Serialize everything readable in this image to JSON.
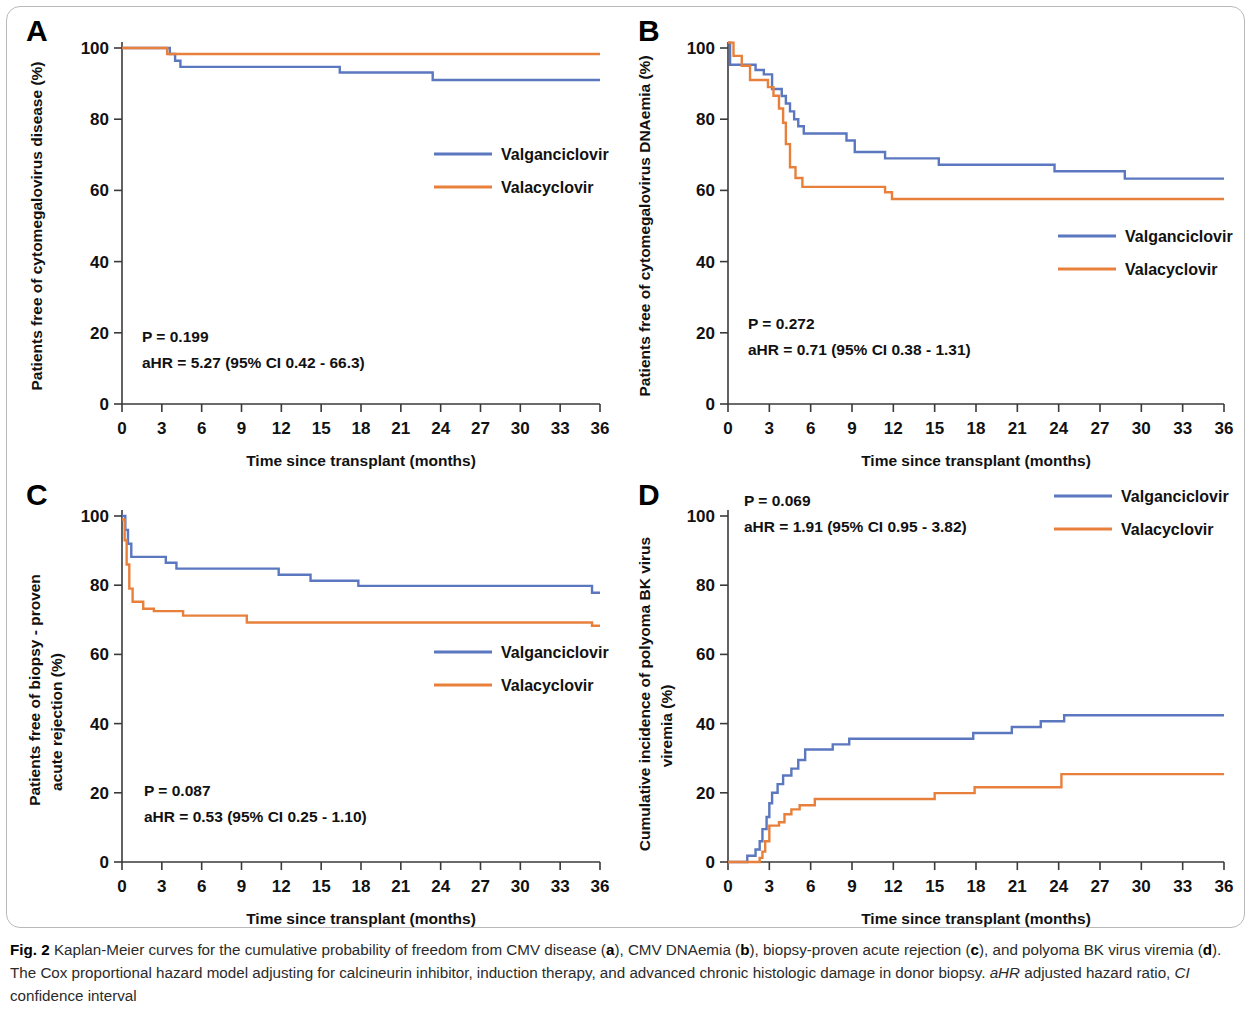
{
  "figure": {
    "label": "Fig. 2",
    "caption_part1": " Kaplan-Meier curves for the cumulative probability of freedom from CMV disease (",
    "caption_a": "a",
    "caption_part2": "), CMV DNAemia (",
    "caption_b": "b",
    "caption_part3": "), biopsy-proven acute rejection (",
    "caption_c": "c",
    "caption_part4": "), and polyoma BK virus viremia (",
    "caption_d": "d",
    "caption_part5": "). The Cox proportional hazard model adjusting for calcineurin inhibitor, induction therapy, and advanced chronic histologic damage in donor biopsy. ",
    "caption_ahr_abbr": "aHR",
    "caption_ahr_def": " adjusted hazard ratio, ",
    "caption_ci_abbr": "CI",
    "caption_ci_def": " confidence interval"
  },
  "colors": {
    "valganciclovir": "#5b77bf",
    "valacyclovir": "#e8803c",
    "axis": "#3a3a3a",
    "text": "#111111",
    "frame": "#b9b9b9"
  },
  "legend": {
    "series_1": "Valganciclovir",
    "series_2": "Valacyclovir"
  },
  "axis_common": {
    "xlabel": "Time since transplant (months)",
    "xticks": [
      "0",
      "3",
      "6",
      "9",
      "12",
      "15",
      "18",
      "21",
      "24",
      "27",
      "30",
      "33",
      "36"
    ],
    "yticks": [
      "0",
      "20",
      "40",
      "60",
      "80",
      "100"
    ],
    "xlim": [
      0,
      36
    ],
    "ylim": [
      0,
      100
    ]
  },
  "panels": {
    "A": {
      "letter": "A",
      "ylabel": "Patients free of cytomegalovirus disease (%)",
      "p_value": "P = 0.199",
      "ahr": "aHR = 5.27 (95% CI 0.42 - 66.3)"
    },
    "B": {
      "letter": "B",
      "ylabel": "Patients free of cytomegalovirus DNAemia (%)",
      "p_value": "P = 0.272",
      "ahr": "aHR = 0.71 (95% CI 0.38 - 1.31)"
    },
    "C": {
      "letter": "C",
      "ylabel_line1": "Patients free of biopsy - proven",
      "ylabel_line2": "acute rejection (%)",
      "p_value": "P = 0.087",
      "ahr": "aHR = 0.53 (95% CI 0.25 - 1.10)"
    },
    "D": {
      "letter": "D",
      "ylabel_line1": "Cumulative incidence of polyoma BK virus",
      "ylabel_line2": "viremia  (%)",
      "p_value": "P = 0.069",
      "ahr": "aHR = 1.91 (95% CI 0.95 - 3.82)"
    }
  },
  "chart_data": [
    {
      "panel": "A",
      "type": "line",
      "subtype": "kaplan-meier-step",
      "title": "Patients free of cytomegalovirus disease (%)",
      "xlabel": "Time since transplant (months)",
      "ylabel": "Patients free of cytomegalovirus disease (%)",
      "xlim": [
        0,
        36
      ],
      "ylim": [
        0,
        100
      ],
      "xticks": [
        0,
        3,
        6,
        9,
        12,
        15,
        18,
        21,
        24,
        27,
        30,
        33,
        36
      ],
      "yticks": [
        0,
        20,
        40,
        60,
        80,
        100
      ],
      "grid": false,
      "legend_position": "center-right",
      "annotations": [
        "P = 0.199",
        "aHR = 5.27 (95% CI 0.42 - 66.3)"
      ],
      "series": [
        {
          "name": "Valganciclovir",
          "color": "#5b77bf",
          "points": [
            [
              0,
              100
            ],
            [
              3.6,
              100
            ],
            [
              3.6,
              98.3
            ],
            [
              4.0,
              98.3
            ],
            [
              4.0,
              96.4
            ],
            [
              4.4,
              96.4
            ],
            [
              4.4,
              94.7
            ],
            [
              16.4,
              94.7
            ],
            [
              16.4,
              93.1
            ],
            [
              23.4,
              93.1
            ],
            [
              23.4,
              91.0
            ],
            [
              36,
              91.0
            ]
          ]
        },
        {
          "name": "Valacyclovir",
          "color": "#e8803c",
          "points": [
            [
              0,
              100
            ],
            [
              3.4,
              100
            ],
            [
              3.4,
              98.3
            ],
            [
              36,
              98.3
            ]
          ]
        }
      ]
    },
    {
      "panel": "B",
      "type": "line",
      "subtype": "kaplan-meier-step",
      "title": "Patients free of cytomegalovirus DNAemia (%)",
      "xlabel": "Time since transplant (months)",
      "ylabel": "Patients free of cytomegalovirus DNAemia (%)",
      "xlim": [
        0,
        36
      ],
      "ylim": [
        0,
        100
      ],
      "xticks": [
        0,
        3,
        6,
        9,
        12,
        15,
        18,
        21,
        24,
        27,
        30,
        33,
        36
      ],
      "yticks": [
        0,
        20,
        40,
        60,
        80,
        100
      ],
      "grid": false,
      "legend_position": "center-right",
      "annotations": [
        "P = 0.272",
        "aHR = 0.71 (95% CI 0.38 - 1.31)"
      ],
      "series": [
        {
          "name": "Valganciclovir",
          "color": "#5b77bf",
          "points": [
            [
              0,
              101.5
            ],
            [
              0.15,
              101.5
            ],
            [
              0.15,
              95.3
            ],
            [
              2.0,
              95.3
            ],
            [
              2.0,
              93.8
            ],
            [
              2.6,
              93.8
            ],
            [
              2.6,
              92.6
            ],
            [
              3.2,
              92.6
            ],
            [
              3.2,
              88.5
            ],
            [
              3.9,
              88.5
            ],
            [
              3.9,
              86.5
            ],
            [
              4.2,
              86.5
            ],
            [
              4.2,
              84.4
            ],
            [
              4.5,
              84.4
            ],
            [
              4.5,
              82.2
            ],
            [
              4.8,
              82.2
            ],
            [
              4.8,
              80.0
            ],
            [
              5.1,
              80.0
            ],
            [
              5.1,
              78.0
            ],
            [
              5.5,
              78.0
            ],
            [
              5.5,
              76.0
            ],
            [
              8.6,
              76.0
            ],
            [
              8.6,
              74.0
            ],
            [
              9.2,
              74.0
            ],
            [
              9.2,
              70.8
            ],
            [
              11.4,
              70.8
            ],
            [
              11.4,
              69.0
            ],
            [
              15.3,
              69.0
            ],
            [
              15.3,
              67.2
            ],
            [
              23.7,
              67.2
            ],
            [
              23.7,
              65.4
            ],
            [
              28.8,
              65.4
            ],
            [
              28.8,
              63.3
            ],
            [
              36,
              63.3
            ]
          ]
        },
        {
          "name": "Valacyclovir",
          "color": "#e8803c",
          "points": [
            [
              0,
              101.5
            ],
            [
              0.4,
              101.5
            ],
            [
              0.4,
              97.8
            ],
            [
              1.0,
              97.8
            ],
            [
              1.0,
              95.0
            ],
            [
              1.6,
              95.0
            ],
            [
              1.6,
              91.0
            ],
            [
              2.9,
              91.0
            ],
            [
              2.9,
              89.0
            ],
            [
              3.3,
              89.0
            ],
            [
              3.3,
              86.6
            ],
            [
              3.7,
              86.6
            ],
            [
              3.7,
              83.0
            ],
            [
              4.0,
              83.0
            ],
            [
              4.0,
              79.0
            ],
            [
              4.2,
              79.0
            ],
            [
              4.2,
              73.0
            ],
            [
              4.5,
              73.0
            ],
            [
              4.5,
              66.5
            ],
            [
              4.9,
              66.5
            ],
            [
              4.9,
              63.5
            ],
            [
              5.4,
              63.5
            ],
            [
              5.4,
              61.0
            ],
            [
              11.4,
              61.0
            ],
            [
              11.4,
              59.5
            ],
            [
              11.9,
              59.5
            ],
            [
              11.9,
              57.6
            ],
            [
              36,
              57.6
            ]
          ]
        }
      ]
    },
    {
      "panel": "C",
      "type": "line",
      "subtype": "kaplan-meier-step",
      "title": "Patients free of biopsy - proven acute rejection (%)",
      "xlabel": "Time since transplant (months)",
      "ylabel": "Patients free of biopsy - proven acute rejection (%)",
      "xlim": [
        0,
        36
      ],
      "ylim": [
        0,
        100
      ],
      "xticks": [
        0,
        3,
        6,
        9,
        12,
        15,
        18,
        21,
        24,
        27,
        30,
        33,
        36
      ],
      "yticks": [
        0,
        20,
        40,
        60,
        80,
        100
      ],
      "grid": false,
      "legend_position": "center-right",
      "annotations": [
        "P = 0.087",
        "aHR = 0.53 (95% CI 0.25 - 1.10)"
      ],
      "series": [
        {
          "name": "Valganciclovir",
          "color": "#5b77bf",
          "points": [
            [
              0,
              100
            ],
            [
              0.25,
              100
            ],
            [
              0.25,
              96.0
            ],
            [
              0.45,
              96.0
            ],
            [
              0.45,
              92.0
            ],
            [
              0.7,
              92.0
            ],
            [
              0.7,
              88.2
            ],
            [
              3.3,
              88.2
            ],
            [
              3.3,
              86.5
            ],
            [
              4.1,
              86.5
            ],
            [
              4.1,
              84.8
            ],
            [
              11.8,
              84.8
            ],
            [
              11.8,
              83.0
            ],
            [
              14.2,
              83.0
            ],
            [
              14.2,
              81.3
            ],
            [
              17.8,
              81.3
            ],
            [
              17.8,
              79.8
            ],
            [
              35.4,
              79.8
            ],
            [
              35.4,
              77.8
            ],
            [
              36,
              77.8
            ]
          ]
        },
        {
          "name": "Valacyclovir",
          "color": "#e8803c",
          "points": [
            [
              0,
              99.0
            ],
            [
              0.2,
              99.0
            ],
            [
              0.2,
              93.0
            ],
            [
              0.35,
              93.0
            ],
            [
              0.35,
              86.0
            ],
            [
              0.55,
              86.0
            ],
            [
              0.55,
              79.0
            ],
            [
              0.8,
              79.0
            ],
            [
              0.8,
              75.2
            ],
            [
              1.6,
              75.2
            ],
            [
              1.6,
              73.2
            ],
            [
              2.4,
              73.2
            ],
            [
              2.4,
              72.5
            ],
            [
              4.6,
              72.5
            ],
            [
              4.6,
              71.2
            ],
            [
              9.4,
              71.2
            ],
            [
              9.4,
              69.2
            ],
            [
              35.4,
              69.2
            ],
            [
              35.4,
              68.3
            ],
            [
              36,
              68.3
            ]
          ]
        }
      ]
    },
    {
      "panel": "D",
      "type": "line",
      "subtype": "cumulative-incidence-step",
      "title": "Cumulative incidence of polyoma BK virus viremia (%)",
      "xlabel": "Time since transplant (months)",
      "ylabel": "Cumulative incidence of polyoma BK virus viremia (%)",
      "xlim": [
        0,
        36
      ],
      "ylim": [
        0,
        100
      ],
      "xticks": [
        0,
        3,
        6,
        9,
        12,
        15,
        18,
        21,
        24,
        27,
        30,
        33,
        36
      ],
      "yticks": [
        0,
        20,
        40,
        60,
        80,
        100
      ],
      "grid": false,
      "legend_position": "top-right",
      "annotations": [
        "P = 0.069",
        "aHR = 1.91 (95% CI 0.95 - 3.82)"
      ],
      "series": [
        {
          "name": "Valganciclovir",
          "color": "#5b77bf",
          "points": [
            [
              0,
              0
            ],
            [
              1.4,
              0
            ],
            [
              1.4,
              1.8
            ],
            [
              2.0,
              1.8
            ],
            [
              2.0,
              3.6
            ],
            [
              2.3,
              3.6
            ],
            [
              2.3,
              6.0
            ],
            [
              2.5,
              6.0
            ],
            [
              2.5,
              9.5
            ],
            [
              2.8,
              9.5
            ],
            [
              2.8,
              13.0
            ],
            [
              3.0,
              13.0
            ],
            [
              3.0,
              17.0
            ],
            [
              3.2,
              17.0
            ],
            [
              3.2,
              20.0
            ],
            [
              3.6,
              20.0
            ],
            [
              3.6,
              22.5
            ],
            [
              4.0,
              22.5
            ],
            [
              4.0,
              25.0
            ],
            [
              4.6,
              25.0
            ],
            [
              4.6,
              27.0
            ],
            [
              5.1,
              27.0
            ],
            [
              5.1,
              29.5
            ],
            [
              5.6,
              29.5
            ],
            [
              5.6,
              32.5
            ],
            [
              7.6,
              32.5
            ],
            [
              7.6,
              34.0
            ],
            [
              8.8,
              34.0
            ],
            [
              8.8,
              35.6
            ],
            [
              17.8,
              35.6
            ],
            [
              17.8,
              37.3
            ],
            [
              20.6,
              37.3
            ],
            [
              20.6,
              39.0
            ],
            [
              22.7,
              39.0
            ],
            [
              22.7,
              40.7
            ],
            [
              24.4,
              40.7
            ],
            [
              24.4,
              42.4
            ],
            [
              36,
              42.4
            ]
          ]
        },
        {
          "name": "Valacyclovir",
          "color": "#e8803c",
          "points": [
            [
              0,
              0
            ],
            [
              2.3,
              0
            ],
            [
              2.3,
              1.2
            ],
            [
              2.5,
              1.2
            ],
            [
              2.5,
              3.0
            ],
            [
              2.7,
              3.0
            ],
            [
              2.7,
              6.0
            ],
            [
              3.0,
              6.0
            ],
            [
              3.0,
              10.5
            ],
            [
              3.7,
              10.5
            ],
            [
              3.7,
              11.5
            ],
            [
              4.1,
              11.5
            ],
            [
              4.1,
              13.8
            ],
            [
              4.6,
              13.8
            ],
            [
              4.6,
              15.2
            ],
            [
              5.2,
              15.2
            ],
            [
              5.2,
              16.4
            ],
            [
              6.3,
              16.4
            ],
            [
              6.3,
              18.2
            ],
            [
              15.0,
              18.2
            ],
            [
              15.0,
              19.9
            ],
            [
              17.9,
              19.9
            ],
            [
              17.9,
              21.6
            ],
            [
              24.2,
              21.6
            ],
            [
              24.2,
              25.4
            ],
            [
              36,
              25.4
            ]
          ]
        }
      ]
    }
  ]
}
